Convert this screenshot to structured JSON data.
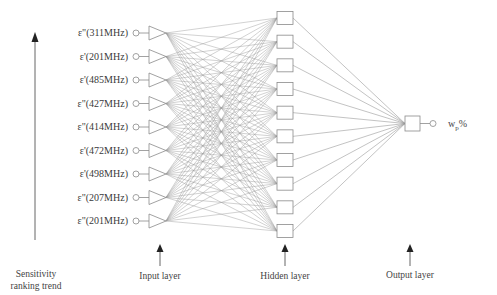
{
  "diagram": {
    "title": "",
    "inputs": [
      {
        "label": "ε\"(311MHz)"
      },
      {
        "label": "ε'(201MHz)"
      },
      {
        "label": "ε'(485MHz)"
      },
      {
        "label": "ε\"(427MHz)"
      },
      {
        "label": "ε\"(414MHz)"
      },
      {
        "label": "ε'(472MHz)"
      },
      {
        "label": "ε'(498MHz)"
      },
      {
        "label": "ε\"(207MHz)"
      },
      {
        "label": "ε\"(201MHz)"
      }
    ],
    "hidden_count": 10,
    "output": {
      "label_main": "w",
      "label_sub": "p",
      "label_suffix": "%"
    },
    "captions": {
      "sensitivity_line1": "Sensitivity",
      "sensitivity_line2": "ranking trend",
      "input_layer": "Input layer",
      "hidden_layer": "Hidden layer",
      "output_layer": "Output layer"
    },
    "colors": {
      "line": "#9a9a9a",
      "box": "#8a8a8a",
      "arrow": "#222222",
      "text": "#3a3a3a"
    }
  }
}
